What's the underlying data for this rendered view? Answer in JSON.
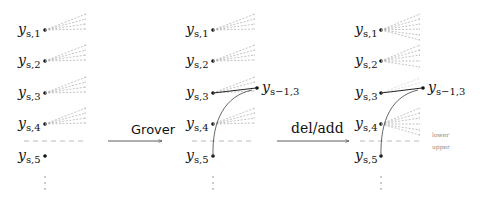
{
  "panels": [
    {
      "name": "initial",
      "nodes": [
        {
          "label": "y",
          "sub": "s,1"
        },
        {
          "label": "y",
          "sub": "s,2"
        },
        {
          "label": "y",
          "sub": "s,3"
        },
        {
          "label": "y",
          "sub": "s,4"
        },
        {
          "label": "y",
          "sub": "s,5"
        }
      ]
    },
    {
      "name": "after-grover",
      "nodes": [
        {
          "label": "y",
          "sub": "s,1"
        },
        {
          "label": "y",
          "sub": "s,2"
        },
        {
          "label": "y",
          "sub": "s,3"
        },
        {
          "label": "y",
          "sub": "s,4"
        },
        {
          "label": "y",
          "sub": "s,5"
        }
      ],
      "extra_node": {
        "label": "y",
        "sub": "s−1,3"
      }
    },
    {
      "name": "after-del-add",
      "nodes": [
        {
          "label": "y",
          "sub": "s,1"
        },
        {
          "label": "y",
          "sub": "s,2"
        },
        {
          "label": "y",
          "sub": "s,3"
        },
        {
          "label": "y",
          "sub": "s,4"
        },
        {
          "label": "y",
          "sub": "s,5"
        }
      ],
      "extra_node": {
        "label": "y",
        "sub": "s−1,3"
      },
      "region_labels": {
        "lower": "lower",
        "upper": "upper"
      }
    }
  ],
  "arrows": [
    {
      "label": "Grover"
    },
    {
      "label": "del/add"
    }
  ],
  "colors": {
    "node": "#111111",
    "fan_line": "#9a9a9a",
    "divider": "#bbbbbb",
    "curve": "#555555"
  }
}
